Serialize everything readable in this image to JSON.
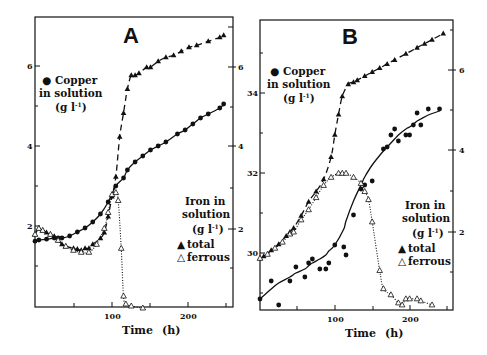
{
  "chart_data": [
    {
      "type": "line",
      "panel": "A",
      "title": "A",
      "xlabel": "Time (h)",
      "x_ticks": [
        100,
        200
      ],
      "x_minor_ticks": [
        50,
        150,
        250
      ],
      "xlim": [
        0,
        258
      ],
      "left_axis": {
        "label": "Copper in solution (g l-1)",
        "ticks": [
          2,
          4,
          6
        ],
        "minor_ticks": [
          3,
          5
        ],
        "ylim": [
          0.0,
          7.2
        ]
      },
      "right_axis": {
        "label": "Iron in solution (g l-1)",
        "ticks": [
          2,
          4,
          6
        ],
        "minor_ticks": [
          1,
          3,
          5,
          7
        ],
        "ylim": [
          0.0,
          7.2
        ]
      },
      "legend": {
        "copper": "Copper in solution (g l-1)",
        "iron_title": [
          "Iron in",
          "solution",
          "(g l-1)"
        ],
        "total": "total",
        "ferrous": "ferrous"
      },
      "series": [
        {
          "name": "Copper in solution",
          "axis": "left",
          "marker": "filled-circle",
          "line": "solid",
          "x": [
            0,
            5,
            15,
            25,
            30,
            35,
            45,
            55,
            65,
            75,
            85,
            95,
            105,
            115,
            120,
            130,
            140,
            150,
            160,
            170,
            185,
            195,
            205,
            215,
            225,
            240,
            245
          ],
          "y": [
            1.62,
            1.65,
            1.67,
            1.7,
            1.7,
            1.7,
            1.75,
            1.85,
            1.95,
            2.1,
            2.3,
            2.6,
            3.0,
            3.2,
            3.4,
            3.6,
            3.75,
            3.9,
            4.0,
            4.1,
            4.3,
            4.4,
            4.55,
            4.7,
            4.8,
            4.95,
            5.05
          ]
        },
        {
          "name": "Iron total",
          "axis": "right",
          "marker": "filled-triangle",
          "line": "dashed",
          "x": [
            0,
            5,
            10,
            15,
            20,
            25,
            30,
            35,
            40,
            50,
            55,
            60,
            65,
            70,
            75,
            85,
            90,
            95,
            100,
            105,
            110,
            115,
            120,
            125,
            130,
            135,
            145,
            150,
            160,
            170,
            180,
            190,
            200,
            210,
            225,
            240,
            245
          ],
          "y": [
            1.85,
            2.0,
            1.95,
            1.9,
            1.85,
            1.8,
            1.7,
            1.6,
            1.55,
            1.5,
            1.48,
            1.45,
            1.5,
            1.5,
            1.6,
            1.75,
            1.9,
            2.3,
            2.8,
            3.3,
            4.3,
            4.9,
            5.5,
            5.85,
            5.85,
            5.9,
            6.05,
            6.05,
            6.2,
            6.3,
            6.35,
            6.45,
            6.55,
            6.6,
            6.7,
            6.8,
            6.85
          ]
        },
        {
          "name": "Iron ferrous",
          "axis": "right",
          "marker": "open-triangle",
          "line": "dotted",
          "x": [
            0,
            5,
            10,
            20,
            30,
            40,
            50,
            60,
            70,
            80,
            90,
            95,
            100,
            105,
            108,
            112,
            115,
            118,
            125,
            140
          ],
          "y": [
            1.85,
            2.0,
            1.95,
            1.85,
            1.7,
            1.55,
            1.45,
            1.4,
            1.4,
            1.6,
            2.0,
            2.4,
            2.85,
            2.9,
            2.7,
            1.5,
            0.3,
            0.1,
            0.05,
            0.0
          ]
        }
      ]
    },
    {
      "type": "line",
      "panel": "B",
      "title": "B",
      "xlabel": "Time (h)",
      "x_ticks": [
        100,
        200
      ],
      "x_minor_ticks": [
        50,
        150,
        250
      ],
      "xlim": [
        0,
        257
      ],
      "left_axis": {
        "label": "Copper in solution (g l-1)",
        "ticks": [
          30,
          32,
          34
        ],
        "minor_ticks": [
          29,
          31,
          33,
          35
        ],
        "ylim": [
          28.6,
          35.8
        ]
      },
      "right_axis": {
        "label": "Iron in solution (g l-1)",
        "ticks": [
          2,
          4,
          6
        ],
        "minor_ticks": [
          1,
          3,
          5,
          7
        ],
        "ylim": [
          0.0,
          7.2
        ]
      },
      "legend": {
        "copper": "Copper in solution (g l-1)",
        "iron_title": [
          "Iron in",
          "solution",
          "(g l-1)"
        ],
        "total": "total",
        "ferrous": "ferrous"
      },
      "series": [
        {
          "name": "Copper in solution",
          "axis": "left",
          "marker": "filled-circle",
          "line": "solid",
          "x": [
            0,
            15,
            25,
            40,
            48,
            60,
            65,
            70,
            80,
            88,
            92,
            100,
            112,
            115,
            125,
            135,
            140,
            150,
            165,
            170,
            175,
            180,
            185,
            195,
            200,
            205,
            210,
            215,
            225,
            240
          ],
          "y": [
            28.85,
            29.3,
            28.7,
            29.3,
            29.65,
            29.4,
            29.75,
            29.85,
            29.6,
            29.6,
            29.75,
            30.2,
            30.15,
            29.95,
            30.95,
            31.6,
            31.7,
            31.8,
            32.6,
            32.65,
            32.95,
            33.1,
            32.8,
            32.95,
            32.95,
            33.2,
            33.5,
            33.2,
            33.6,
            33.6
          ],
          "fit_y": [
            28.85,
            29.1,
            29.25,
            29.4,
            29.5,
            29.6,
            29.68,
            29.75,
            29.85,
            29.95,
            30.05,
            30.2,
            30.6,
            30.8,
            31.3,
            31.7,
            31.9,
            32.2,
            32.55,
            32.65,
            32.75,
            32.85,
            32.95,
            33.1,
            33.15,
            33.22,
            33.3,
            33.35,
            33.45,
            33.55
          ]
        },
        {
          "name": "Iron total",
          "axis": "right",
          "marker": "filled-triangle",
          "line": "dashed",
          "x": [
            0,
            5,
            15,
            25,
            35,
            40,
            45,
            55,
            65,
            75,
            85,
            95,
            100,
            105,
            110,
            118,
            125,
            130,
            140,
            150,
            160,
            170,
            180,
            195,
            210,
            220,
            230,
            245
          ],
          "y": [
            1.35,
            1.4,
            1.55,
            1.7,
            1.9,
            2.0,
            2.1,
            2.4,
            2.75,
            3.0,
            3.3,
            3.85,
            4.4,
            4.9,
            5.35,
            5.65,
            5.7,
            5.75,
            5.85,
            5.95,
            6.05,
            6.15,
            6.25,
            6.4,
            6.55,
            6.65,
            6.75,
            6.9
          ]
        },
        {
          "name": "Iron ferrous",
          "axis": "right",
          "marker": "open-triangle",
          "line": "dotted",
          "x": [
            0,
            10,
            20,
            30,
            40,
            45,
            55,
            65,
            75,
            85,
            95,
            105,
            110,
            115,
            125,
            135,
            140,
            145,
            150,
            160,
            165,
            175,
            185,
            190,
            195,
            200,
            210,
            215,
            230
          ],
          "y": [
            1.35,
            1.45,
            1.6,
            1.75,
            1.95,
            2.0,
            2.3,
            2.55,
            2.85,
            3.15,
            3.35,
            3.45,
            3.45,
            3.45,
            3.35,
            3.2,
            3.0,
            2.8,
            2.25,
            1.05,
            0.6,
            0.45,
            0.25,
            0.2,
            0.35,
            0.35,
            0.35,
            0.3,
            0.2
          ]
        }
      ]
    }
  ],
  "panels": {
    "a": {
      "letter": "A",
      "left_ticks": [
        "6",
        "4",
        "2"
      ],
      "right_ticks": [
        "6",
        "4",
        "2"
      ],
      "x_ticks": [
        "100",
        "200"
      ]
    },
    "b": {
      "letter": "B",
      "left_ticks": [
        "34",
        "32",
        "30"
      ],
      "right_ticks": [
        "6",
        "4",
        "2"
      ],
      "x_ticks": [
        "100",
        "200"
      ]
    }
  },
  "legend": {
    "copper_line1": "Copper",
    "copper_line2": "in solution",
    "copper_line3": "(g l",
    "copper_exp": "-1",
    "iron_line1": "Iron in",
    "iron_line2": "solution",
    "iron_line3": "(g l",
    "iron_exp": "-1",
    "total": "total",
    "ferrous": "ferrous",
    "bullet": "●",
    "filled_triangle": "▲",
    "open_triangle": "△"
  },
  "axis": {
    "xlabel_time": "Time",
    "xlabel_unit": "(h)"
  }
}
